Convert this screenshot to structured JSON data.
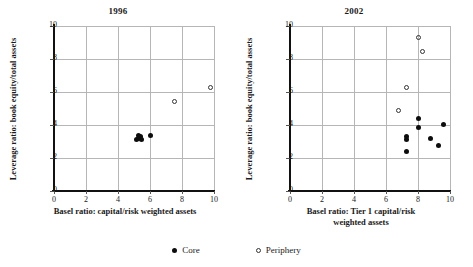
{
  "chart_data": [
    {
      "type": "scatter",
      "title": "1996",
      "xlabel": "Basel ratio: capital/risk weighted assets",
      "ylabel": "Leverage ratio: book equity/total assets",
      "xlim": [
        0,
        10
      ],
      "ylim": [
        0,
        10
      ],
      "xticks": [
        0,
        2,
        4,
        6,
        8,
        10
      ],
      "yticks": [
        0,
        2,
        4,
        6,
        8,
        10
      ],
      "grid": true,
      "series": [
        {
          "name": "Core",
          "marker": "filled-circle",
          "points": [
            [
              5.15,
              3.15
            ],
            [
              5.25,
              3.35
            ],
            [
              5.3,
              3.2
            ],
            [
              5.4,
              3.3
            ],
            [
              5.45,
              3.1
            ],
            [
              6.0,
              3.35
            ]
          ]
        },
        {
          "name": "Periphery",
          "marker": "open-circle",
          "points": [
            [
              7.55,
              5.4
            ],
            [
              9.75,
              6.25
            ]
          ]
        }
      ]
    },
    {
      "type": "scatter",
      "title": "2002",
      "xlabel": "Basel ratio: Tier 1 capital/risk weighted assets",
      "xlabel_lines": [
        "Basel ratio: Tier 1 capital/risk",
        "weighted assets"
      ],
      "ylabel": "Leverage ratio: book equity/total assets",
      "xlim": [
        0,
        10
      ],
      "ylim": [
        0,
        10
      ],
      "xticks": [
        0,
        2,
        4,
        6,
        8,
        10
      ],
      "yticks": [
        0,
        2,
        4,
        6,
        8,
        10
      ],
      "grid": true,
      "series": [
        {
          "name": "Core",
          "marker": "filled-circle",
          "points": [
            [
              7.25,
              3.3
            ],
            [
              7.3,
              3.15
            ],
            [
              7.3,
              2.4
            ],
            [
              8.05,
              4.4
            ],
            [
              8.05,
              3.85
            ],
            [
              8.75,
              3.2
            ],
            [
              9.3,
              2.75
            ],
            [
              9.6,
              4.05
            ]
          ]
        },
        {
          "name": "Periphery",
          "marker": "open-circle",
          "points": [
            [
              6.75,
              4.85
            ],
            [
              7.25,
              6.25
            ],
            [
              8.0,
              9.3
            ],
            [
              8.3,
              8.45
            ]
          ]
        }
      ]
    }
  ],
  "legend": {
    "position": "bottom-center",
    "entries": [
      {
        "label": "Core",
        "marker": "filled-circle"
      },
      {
        "label": "Periphery",
        "marker": "open-circle"
      }
    ]
  }
}
